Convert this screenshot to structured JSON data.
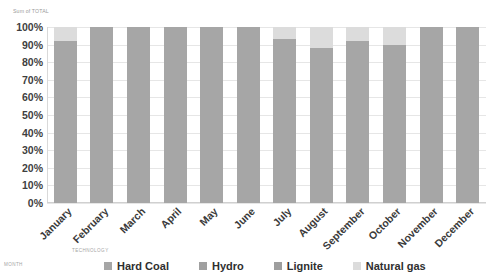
{
  "title": "Sum of TOTAL",
  "axis_titles": {
    "technology": "TECHNOLOGY",
    "month": "MONTH"
  },
  "colors": {
    "hard_coal": "#a6a6a6",
    "hydro": "#a0a0a0",
    "lignite": "#9e9e9e",
    "natural_gas": "#dcdcdc",
    "gridline": "#e6e6e6",
    "tick_text": "#3f3f3f",
    "axis_title_text": "#a5a5a5"
  },
  "legend": {
    "items": [
      {
        "label": "Hard Coal",
        "color": "#a6a6a6"
      },
      {
        "label": "Hydro",
        "color": "#a0a0a0"
      },
      {
        "label": "Lignite",
        "color": "#9e9e9e"
      },
      {
        "label": "Natural gas",
        "color": "#dcdcdc"
      }
    ]
  },
  "chart_data": {
    "type": "bar",
    "stacked": true,
    "stack_mode": "100%",
    "title": "Sum of TOTAL",
    "xlabel": "TECHNOLOGY",
    "ylabel": "MONTH",
    "ylim": [
      0,
      100
    ],
    "ytick_labels": [
      "100%",
      "90%",
      "80%",
      "70%",
      "60%",
      "50%",
      "40%",
      "30%",
      "20%",
      "10%",
      "0%"
    ],
    "ytick_values": [
      100,
      90,
      80,
      70,
      60,
      50,
      40,
      30,
      20,
      10,
      0
    ],
    "grid": true,
    "legend_position": "bottom",
    "categories": [
      "January",
      "February",
      "March",
      "April",
      "May",
      "June",
      "July",
      "August",
      "September",
      "October",
      "November",
      "December"
    ],
    "series": [
      {
        "name": "Hard Coal",
        "color": "#a6a6a6",
        "values": [
          92,
          100,
          100,
          100,
          100,
          100,
          93,
          88,
          92,
          90,
          100,
          100
        ]
      },
      {
        "name": "Hydro",
        "color": "#a0a0a0",
        "values": [
          0,
          0,
          0,
          0,
          0,
          0,
          0,
          0,
          0,
          0,
          0,
          0
        ]
      },
      {
        "name": "Lignite",
        "color": "#9e9e9e",
        "values": [
          0,
          0,
          0,
          0,
          0,
          0,
          0,
          0,
          0,
          0,
          0,
          0
        ]
      },
      {
        "name": "Natural gas",
        "color": "#dcdcdc",
        "values": [
          8,
          0,
          0,
          0,
          0,
          0,
          7,
          12,
          8,
          10,
          0,
          0
        ]
      }
    ]
  }
}
